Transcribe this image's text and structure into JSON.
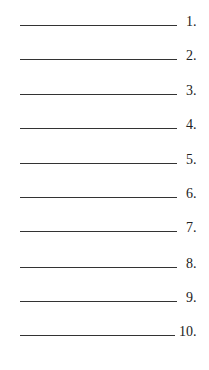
{
  "answer_lines": [
    {
      "number": "1.",
      "value": ""
    },
    {
      "number": "2.",
      "value": ""
    },
    {
      "number": "3.",
      "value": ""
    },
    {
      "number": "4.",
      "value": ""
    },
    {
      "number": "5.",
      "value": ""
    },
    {
      "number": "6.",
      "value": ""
    },
    {
      "number": "7.",
      "value": ""
    },
    {
      "number": "8.",
      "value": ""
    },
    {
      "number": "9.",
      "value": ""
    },
    {
      "number": "10.",
      "value": ""
    }
  ]
}
